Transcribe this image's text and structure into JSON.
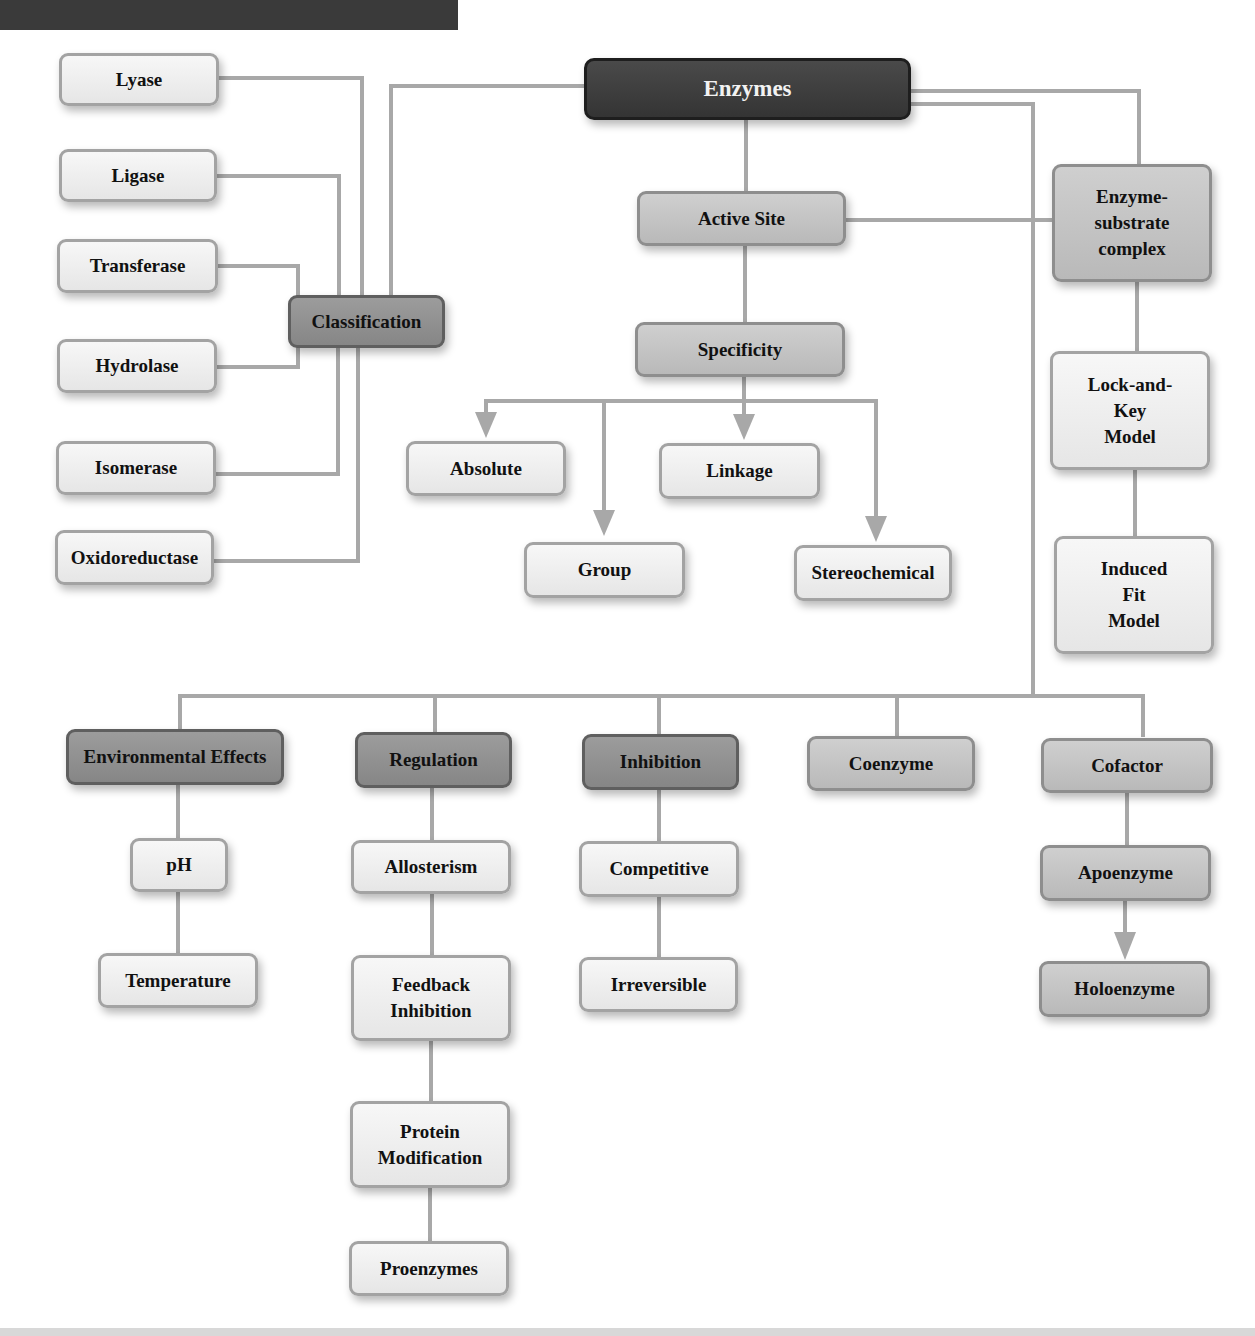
{
  "diagram": {
    "title": "Enzymes",
    "colors": {
      "root_fill": "#3c3c3c",
      "dark_fill": "#8f8f8f",
      "mid_fill": "#c4c4c4",
      "light_fill": "#eeeeee",
      "connector": "#a8a8a8"
    },
    "root": {
      "label": "Enzymes"
    },
    "classification": {
      "label": "Classification",
      "children": [
        "Lyase",
        "Ligase",
        "Transferase",
        "Hydrolase",
        "Isomerase",
        "Oxidoreductase"
      ]
    },
    "active_site": {
      "label": "Active Site",
      "specificity": {
        "label": "Specificity",
        "children": [
          "Absolute",
          "Group",
          "Linkage",
          "Stereochemical"
        ]
      }
    },
    "enzyme_substrate": {
      "label": "Enzyme-substrate complex",
      "lines": [
        "Enzyme-",
        "substrate",
        "complex"
      ],
      "lock_and_key": {
        "lines": [
          "Lock-and-",
          "Key",
          "Model"
        ]
      },
      "induced_fit": {
        "lines": [
          "Induced",
          "Fit",
          "Model"
        ]
      }
    },
    "environmental_effects": {
      "label": "Environmental Effects",
      "children": [
        "pH",
        "Temperature"
      ]
    },
    "regulation": {
      "label": "Regulation",
      "allosterism": "Allosterism",
      "feedback": {
        "lines": [
          "Feedback",
          "Inhibition"
        ]
      },
      "protein_mod": {
        "lines": [
          "Protein",
          "Modification"
        ]
      },
      "proenzymes": "Proenzymes"
    },
    "inhibition": {
      "label": "Inhibition",
      "children": [
        "Competitive",
        "Irreversible"
      ]
    },
    "coenzyme": {
      "label": "Coenzyme"
    },
    "cofactor": {
      "label": "Cofactor",
      "children": [
        "Apoenzyme",
        "Holoenzyme"
      ]
    }
  }
}
